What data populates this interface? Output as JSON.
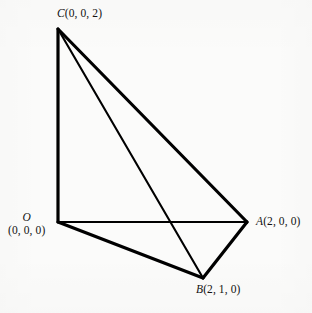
{
  "figure": {
    "type": "geometric-diagram",
    "background_color": "#fbfbfa",
    "stroke_color": "#000000",
    "canvas": {
      "width": 312,
      "height": 313
    },
    "vertices": [
      {
        "key": "C",
        "point_label": "C",
        "coords_label": "(0, 0, 2)",
        "x": 58,
        "y": 29,
        "coords3d": [
          0,
          0,
          2
        ]
      },
      {
        "key": "O",
        "point_label": "O",
        "coords_label": "(0, 0, 0)",
        "x": 58,
        "y": 222,
        "coords3d": [
          0,
          0,
          0
        ]
      },
      {
        "key": "A",
        "point_label": "A",
        "coords_label": "(2, 0, 0)",
        "x": 247,
        "y": 222,
        "coords3d": [
          2,
          0,
          0
        ]
      },
      {
        "key": "B",
        "point_label": "B",
        "coords_label": "(2, 1, 0)",
        "x": 203,
        "y": 278,
        "coords3d": [
          2,
          1,
          0
        ]
      }
    ],
    "edges": [
      {
        "from": "O",
        "to": "C",
        "weight": 3.2
      },
      {
        "from": "O",
        "to": "A",
        "weight": 2.1
      },
      {
        "from": "O",
        "to": "B",
        "weight": 3.2
      },
      {
        "from": "C",
        "to": "A",
        "weight": 3.2
      },
      {
        "from": "C",
        "to": "B",
        "weight": 2.1
      },
      {
        "from": "A",
        "to": "B",
        "weight": 3.2
      }
    ]
  },
  "labels": {
    "c": {
      "point": "C",
      "coords": "(0, 0, 2)"
    },
    "o": {
      "point": "O",
      "coords": "(0, 0, 0)"
    },
    "a": {
      "point": "A",
      "coords": "(2, 0, 0)"
    },
    "b": {
      "point": "B",
      "coords": "(2, 1, 0)"
    }
  }
}
